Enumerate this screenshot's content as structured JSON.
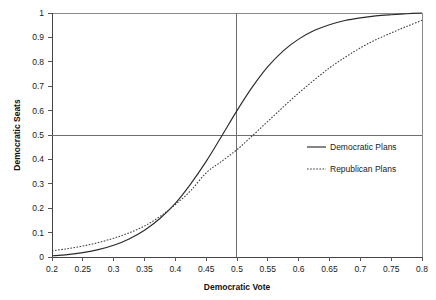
{
  "chart_data": {
    "type": "line",
    "title": "",
    "xlabel": "Democratic Vote",
    "ylabel": "Democratic Seats",
    "xlim": [
      0.2,
      0.8
    ],
    "ylim": [
      0,
      1
    ],
    "grid": false,
    "legend_position": "center-right-inside",
    "x_ticks": [
      "0.2",
      "0.25",
      "0.3",
      "0.35",
      "0.4",
      "0.45",
      "0.5",
      "0.55",
      "0.6",
      "0.65",
      "0.7",
      "0.75",
      "0.8"
    ],
    "x_tick_values": [
      0.2,
      0.25,
      0.3,
      0.35,
      0.4,
      0.45,
      0.5,
      0.55,
      0.6,
      0.65,
      0.7,
      0.75,
      0.8
    ],
    "y_ticks": [
      "0",
      "0.1",
      "0.2",
      "0.3",
      "0.4",
      "0.5",
      "0.6",
      "0.7",
      "0.8",
      "0.9",
      "1"
    ],
    "y_tick_values": [
      0,
      0.1,
      0.2,
      0.3,
      0.4,
      0.5,
      0.6,
      0.7,
      0.8,
      0.9,
      1
    ],
    "reference_lines": [
      {
        "name": "horizontal-half-seats",
        "orientation": "horizontal",
        "value": 0.5
      },
      {
        "name": "vertical-half-vote",
        "orientation": "vertical",
        "value": 0.5
      }
    ],
    "x": [
      0.2,
      0.225,
      0.25,
      0.275,
      0.3,
      0.325,
      0.35,
      0.375,
      0.4,
      0.425,
      0.45,
      0.475,
      0.5,
      0.525,
      0.55,
      0.575,
      0.6,
      0.625,
      0.65,
      0.675,
      0.7,
      0.725,
      0.75,
      0.775,
      0.8
    ],
    "series": [
      {
        "name": "Democratic Plans",
        "style": "solid",
        "color": "#2b2b2b",
        "values": [
          0.005,
          0.01,
          0.018,
          0.03,
          0.048,
          0.074,
          0.11,
          0.158,
          0.22,
          0.3,
          0.392,
          0.495,
          0.6,
          0.697,
          0.78,
          0.845,
          0.893,
          0.928,
          0.952,
          0.969,
          0.98,
          0.988,
          0.993,
          0.997,
          1.0
        ]
      },
      {
        "name": "Republican Plans",
        "style": "dotted",
        "color": "#3a3a3a",
        "values": [
          0.025,
          0.034,
          0.045,
          0.059,
          0.077,
          0.099,
          0.127,
          0.166,
          0.215,
          0.272,
          0.345,
          0.392,
          0.44,
          0.497,
          0.556,
          0.615,
          0.672,
          0.725,
          0.775,
          0.818,
          0.857,
          0.89,
          0.918,
          0.945,
          0.97
        ]
      }
    ]
  },
  "legend": {
    "items": [
      {
        "label": "Democratic Plans",
        "style": "solid"
      },
      {
        "label": "Republican Plans",
        "style": "dotted"
      }
    ]
  }
}
